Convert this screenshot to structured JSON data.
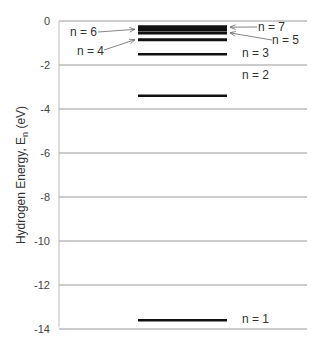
{
  "chart_data": {
    "type": "energy-level-diagram",
    "title": "",
    "ylabel": "Hydrogen Energy, E",
    "ylabel_sub": "n",
    "ylabel_unit": " (eV)",
    "ylim": [
      -14,
      0
    ],
    "yticks": [
      0,
      -2,
      -4,
      -6,
      -8,
      -10,
      -12,
      -14
    ],
    "ytick_labels": [
      "0",
      "-2",
      "-4",
      "-6",
      "-8",
      "-10",
      "-12",
      "-14"
    ],
    "grid": true,
    "levels": [
      {
        "n": 1,
        "label": "n = 1",
        "energy": -13.6
      },
      {
        "n": 2,
        "label": "n = 2",
        "energy": -3.4
      },
      {
        "n": 3,
        "label": "n = 3",
        "energy": -1.51
      },
      {
        "n": 4,
        "label": "n = 4",
        "energy": -0.85
      },
      {
        "n": 5,
        "label": "n = 5",
        "energy": -0.54
      },
      {
        "n": 6,
        "label": "n = 6",
        "energy": -0.38
      },
      {
        "n": 7,
        "label": "n = 7",
        "energy": -0.28
      }
    ]
  }
}
